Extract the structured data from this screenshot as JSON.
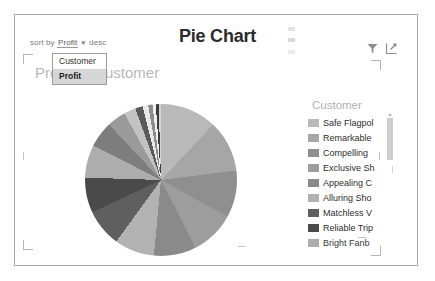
{
  "panel": {
    "title": "Pie Chart",
    "subtitle": "Profit by Customer"
  },
  "sort_bar": {
    "label": "sort by",
    "field": "Profit",
    "caret": "▾",
    "direction": "desc"
  },
  "dropdown": {
    "open": true,
    "options": [
      {
        "label": "Customer",
        "selected": false
      },
      {
        "label": "Profit",
        "selected": true
      }
    ]
  },
  "tool_icons": [
    {
      "name": "filter-icon",
      "title": "Filter"
    },
    {
      "name": "popout-icon",
      "title": "Open in new window"
    }
  ],
  "legend": {
    "title": "Customer",
    "items": [
      {
        "label": "Safe Flagpol",
        "color": "#b9b9b9"
      },
      {
        "label": "Remarkable",
        "color": "#a6a6a6"
      },
      {
        "label": "Compelling",
        "color": "#8f8f8f"
      },
      {
        "label": "Exclusive Sh",
        "color": "#9d9d9d"
      },
      {
        "label": "Appealing C",
        "color": "#8a8a8a"
      },
      {
        "label": "Alluring Sho",
        "color": "#b2b2b2"
      },
      {
        "label": "Matchless V",
        "color": "#5f5f5f"
      },
      {
        "label": "Reliable Trip",
        "color": "#4a4a4a"
      },
      {
        "label": "Bright Fanb",
        "color": "#adadad"
      }
    ]
  },
  "scrollbar": {
    "name": "legend-scrollbar",
    "position": "top"
  },
  "chart_data": {
    "type": "pie",
    "title": "Pie Chart",
    "subtitle": "Profit by Customer",
    "legend_title": "Customer",
    "legend_position": "right",
    "sort_field": "Profit",
    "sort_direction": "desc",
    "categories": [
      "Safe Flagpol",
      "Remarkable",
      "Compelling",
      "Exclusive Sh",
      "Appealing C",
      "Alluring Sho",
      "Matchless V",
      "Reliable Trip",
      "Bright Fanb",
      "Slice 10",
      "Slice 11",
      "Slice 12",
      "Slice 13",
      "Slice 14",
      "Slice 15",
      "Slice 16",
      "Slice 17",
      "Slice 18"
    ],
    "values": [
      12.0,
      11.0,
      10.0,
      9.5,
      9.0,
      8.5,
      8.0,
      7.5,
      7.0,
      5.5,
      4.0,
      2.5,
      1.6,
      1.2,
      0.9,
      0.7,
      0.6,
      0.5
    ],
    "colors": [
      "#b9b9b9",
      "#a6a6a6",
      "#8f8f8f",
      "#9d9d9d",
      "#8a8a8a",
      "#b2b2b2",
      "#5f5f5f",
      "#4a4a4a",
      "#adadad",
      "#7d7d7d",
      "#9a9a9a",
      "#c2c2c2",
      "#5a5a5a",
      "#e8e8e8",
      "#8c8c8c",
      "#f0f0f0",
      "#3d3d3d",
      "#d4d4d4"
    ]
  }
}
